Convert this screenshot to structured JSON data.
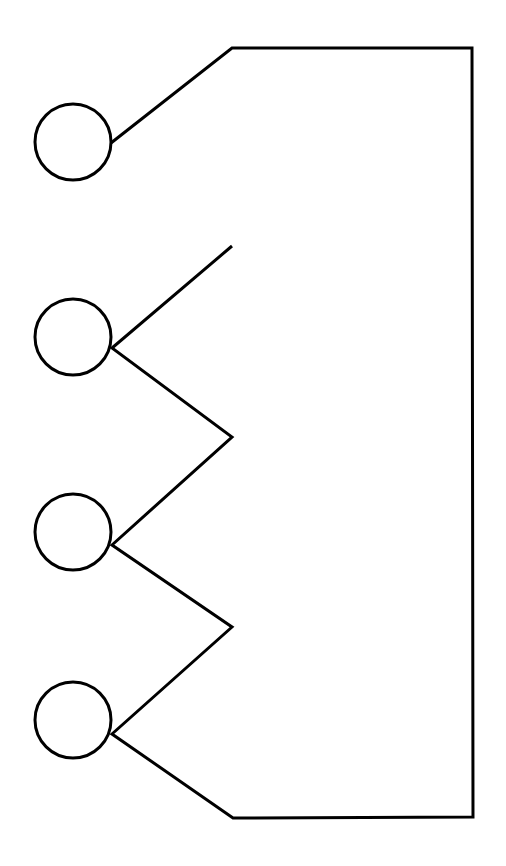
{
  "document": {
    "title": "Line drawing diagram",
    "description": "Black outline schematic: four circles on the left joined by a zigzag polyline to a large right-hand closed region",
    "width": 506,
    "height": 866,
    "background_color": "#ffffff",
    "stroke_color": "#000000",
    "stroke_width": 3,
    "fill": "none"
  },
  "shapes": {
    "circles": [
      {
        "name": "circle-1",
        "cx": 73,
        "cy": 142,
        "r": 38
      },
      {
        "name": "circle-2",
        "cx": 73,
        "cy": 337,
        "r": 38
      },
      {
        "name": "circle-3",
        "cx": 73,
        "cy": 532,
        "r": 38
      },
      {
        "name": "circle-4",
        "cx": 73,
        "cy": 720,
        "r": 38
      }
    ],
    "outline_path": {
      "name": "zigzag-outline",
      "points": "111,143 232,48 472,48 473,817 233,818 112,734 232,627 112,545 232,437 112,348 232,246",
      "closed": false
    },
    "vertices": {
      "top_left_bend": {
        "x": 232,
        "y": 48
      },
      "top_right_corner": {
        "x": 472,
        "y": 48
      },
      "bottom_right_corner": {
        "x": 473,
        "y": 817
      },
      "bottom_left_bend": {
        "x": 233,
        "y": 818
      },
      "zigzag_peaks": [
        {
          "x": 232,
          "y": 246
        },
        {
          "x": 232,
          "y": 437
        },
        {
          "x": 232,
          "y": 627
        }
      ],
      "circle_attach_points": [
        {
          "x": 111,
          "y": 143
        },
        {
          "x": 112,
          "y": 348
        },
        {
          "x": 112,
          "y": 545
        },
        {
          "x": 112,
          "y": 734
        }
      ]
    }
  }
}
